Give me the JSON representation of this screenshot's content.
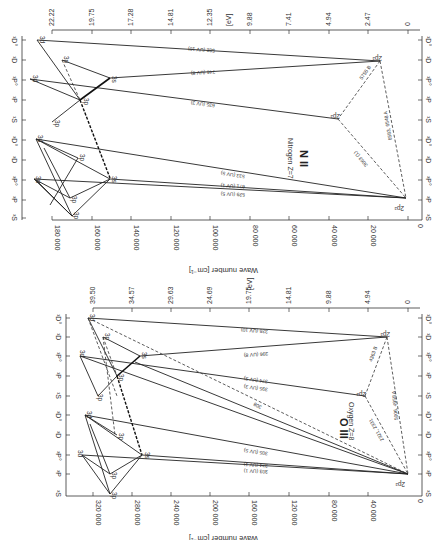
{
  "figure": {
    "orientation": "rotated 90 degrees",
    "panels": [
      {
        "id": "n2",
        "title": "N II",
        "subtitle": "Nitrogen Z=7",
        "ev_axis": {
          "label": "[eV]",
          "ticks": [
            "22.22",
            "19.75",
            "17.28",
            "14.81",
            "12.35",
            "9.88",
            "7.41",
            "4.94",
            "2.47",
            "0"
          ]
        },
        "wave_axis": {
          "label": "Wave number [cm⁻¹]",
          "ticks": [
            "180 000",
            "160 000",
            "140 000",
            "120 000",
            "100 000",
            "80 000",
            "60 000",
            "40 000",
            "20 000",
            "0"
          ]
        },
        "terms": [
          "¹D°",
          "¹D",
          "¹P°",
          "¹P",
          "¹S",
          "³D°",
          "³D",
          "³P°",
          "³P",
          "³S"
        ],
        "line_labels": [
          "582 (UV 10)",
          "746 (UV 8)",
          "635 (UV 3)",
          "533 (UV 5)",
          "671 (UV 1)",
          "529 (UV 5)",
          "5755 B",
          "6583, 6548 A",
          "3063 (1)",
          "3995",
          "4447",
          "4621",
          "3919",
          "4507",
          "5680",
          "4630",
          "5005"
        ],
        "level_labels": [
          "2p²",
          "2p²",
          "2p²",
          "3s",
          "3p",
          "3d",
          "3s",
          "3p",
          "3d"
        ]
      },
      {
        "id": "o3",
        "title": "O III",
        "subtitle": "Oxygen Z=8",
        "ev_axis": {
          "label": "[eV]",
          "ticks": [
            "39.50",
            "34.57",
            "29.63",
            "24.69",
            "19.75",
            "14.81",
            "9.88",
            "4.94",
            "0"
          ]
        },
        "wave_axis": {
          "label": "Wave number [cm⁻¹]",
          "ticks": [
            "320 000",
            "280 000",
            "240 000",
            "200 000",
            "160 000",
            "120 000",
            "80 000",
            "40 000",
            "0"
          ]
        },
        "terms": [
          "¹D°",
          "¹D",
          "¹P°",
          "¹P",
          "¹S",
          "³D°",
          "³D",
          "³P°",
          "³P",
          "³S"
        ],
        "line_labels": [
          "328 (UV 10)",
          "396 (UV 8)",
          "374 (UV 3)",
          "395 (UV 3)",
          "305 (UV 5)",
          "374 (UV 1)",
          "303 (UV 1)",
          "308",
          "4363 B",
          "5006, 4958 A",
          "2321, 2331"
        ],
        "level_labels": [
          "2p²",
          "2p²",
          "2p²",
          "3s",
          "3p",
          "3d",
          "3s",
          "3p",
          "3d"
        ]
      }
    ]
  }
}
